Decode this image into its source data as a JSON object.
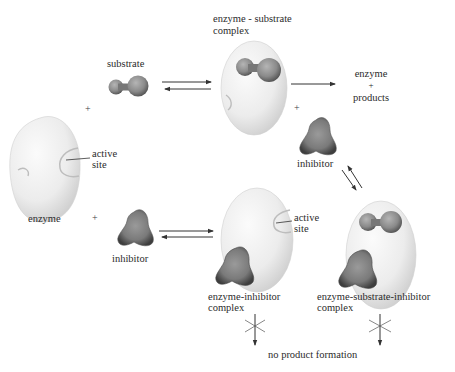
{
  "diagram": {
    "type": "enzyme-inhibition-scheme",
    "labels": {
      "substrate": "substrate",
      "es_complex_line1": "enzyme - substrate",
      "es_complex_line2": "complex",
      "products_line1": "enzyme",
      "products_plus": "+",
      "products_line2": "products",
      "inhibitor_top": "inhibitor",
      "active_site_left_1": "active",
      "active_site_left_2": "site",
      "enzyme": "enzyme",
      "inhibitor_bottom": "inhibitor",
      "active_site_ei_1": "active",
      "active_site_ei_2": "site",
      "ei_complex_line1": "enzyme-inhibitor",
      "ei_complex_line2": "complex",
      "esi_complex_line1": "enzyme-substrate-inhibitor",
      "esi_complex_line2": "complex",
      "no_product": "no product formation"
    },
    "plus_signs": [
      "+",
      "+",
      "+"
    ],
    "nodes": [
      {
        "id": "enzyme",
        "label": "enzyme"
      },
      {
        "id": "substrate",
        "label": "substrate"
      },
      {
        "id": "es_complex",
        "label": "enzyme-substrate complex"
      },
      {
        "id": "products",
        "label": "enzyme + products"
      },
      {
        "id": "inhibitor_1",
        "label": "inhibitor"
      },
      {
        "id": "inhibitor_2",
        "label": "inhibitor"
      },
      {
        "id": "ei_complex",
        "label": "enzyme-inhibitor complex"
      },
      {
        "id": "esi_complex",
        "label": "enzyme-substrate-inhibitor complex"
      },
      {
        "id": "no_product",
        "label": "no product formation"
      }
    ],
    "edges": [
      {
        "from": "substrate",
        "to": "es_complex",
        "type": "reversible"
      },
      {
        "from": "es_complex",
        "to": "products",
        "type": "forward"
      },
      {
        "from": "inhibitor_1",
        "to": "esi_complex",
        "type": "reversible"
      },
      {
        "from": "inhibitor_2",
        "to": "ei_complex",
        "type": "reversible"
      },
      {
        "from": "ei_complex",
        "to": "no_product",
        "type": "blocked"
      },
      {
        "from": "esi_complex",
        "to": "no_product",
        "type": "blocked"
      }
    ],
    "colors": {
      "enzyme_fill": "#eeeeee",
      "enzyme_shade": "#c8c8c8",
      "molecule_fill": "#8a8a8a",
      "molecule_dark": "#4a4a4a",
      "arrow": "#333333",
      "text": "#2b2b2b"
    }
  }
}
